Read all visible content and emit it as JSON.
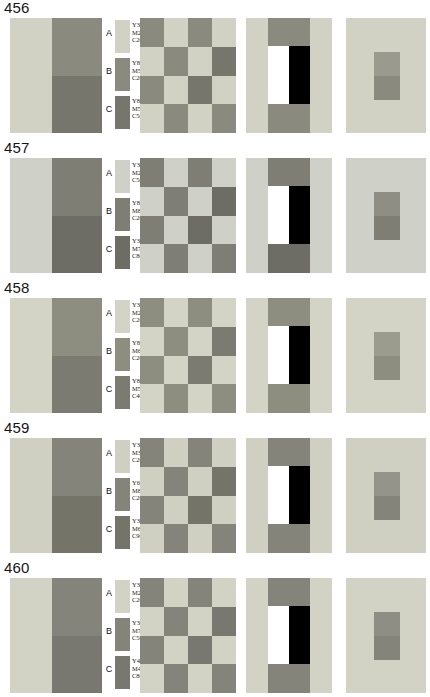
{
  "figure": {
    "legend_labels": [
      "A",
      "B",
      "C"
    ]
  },
  "rows": [
    {
      "number": "456",
      "legend": [
        {
          "label": "A",
          "y": "Y30",
          "m": "M20",
          "c": "C20",
          "swatch": "#d2d2c4"
        },
        {
          "label": "B",
          "y": "Y80",
          "m": "M50",
          "c": "C20",
          "swatch": "#8a8a7e"
        },
        {
          "label": "C",
          "y": "Y80",
          "m": "M50",
          "c": "C50",
          "swatch": "#76766c"
        }
      ],
      "panel1": {
        "left": "#d2d2c4",
        "right_top": "#8a8a7e",
        "right_bottom": "#76766c"
      },
      "panel2": [
        [
          "#8a8a7e",
          "#d2d2c4",
          "#8a8a7e",
          "#d2d2c4"
        ],
        [
          "#d2d2c4",
          "#8a8a7e",
          "#d2d2c4",
          "#76766c"
        ],
        [
          "#8a8a7e",
          "#d2d2c4",
          "#76766c",
          "#d2d2c4"
        ],
        [
          "#d2d2c4",
          "#8a8a7e",
          "#d2d2c4",
          "#8a8a7e"
        ]
      ],
      "panel3": {
        "background": "#d2d2c4",
        "band_top": "#8a8a7e",
        "band_bottom": "#8a8a7e",
        "band_mid": "#8a8a7e",
        "white_bar": "#ffffff",
        "black_bar": "#000000"
      },
      "panel4": {
        "field": "#d2d2c4",
        "patch_top": "#9a9a8e",
        "patch_bottom": "#8a8a7e"
      }
    },
    {
      "number": "457",
      "legend": [
        {
          "label": "A",
          "y": "Y30",
          "m": "M20",
          "c": "C50",
          "swatch": "#cfd0c8"
        },
        {
          "label": "B",
          "y": "Y80",
          "m": "M80",
          "c": "C20",
          "swatch": "#7e7e74"
        },
        {
          "label": "C",
          "y": "Y30",
          "m": "M70",
          "c": "C80",
          "swatch": "#6d6d66"
        }
      ],
      "panel1": {
        "left": "#cfd0c8",
        "right_top": "#7e7e74",
        "right_bottom": "#6d6d66"
      },
      "panel2": [
        [
          "#7e7e74",
          "#cfd0c8",
          "#7e7e74",
          "#cfd0c8"
        ],
        [
          "#cfd0c8",
          "#7e7e74",
          "#cfd0c8",
          "#6d6d66"
        ],
        [
          "#7e7e74",
          "#cfd0c8",
          "#6d6d66",
          "#cfd0c8"
        ],
        [
          "#cfd0c8",
          "#7e7e74",
          "#cfd0c8",
          "#7e7e74"
        ]
      ],
      "panel3": {
        "background": "#cfd0c8",
        "band_top": "#7e7e74",
        "band_bottom": "#6d6d66",
        "band_mid": "#7e7e74",
        "white_bar": "#ffffff",
        "black_bar": "#000000"
      },
      "panel4": {
        "field": "#cfd0c8",
        "patch_top": "#8e8e84",
        "patch_bottom": "#7e7e74"
      }
    },
    {
      "number": "458",
      "legend": [
        {
          "label": "A",
          "y": "Y30",
          "m": "M20",
          "c": "C20",
          "swatch": "#d4d4c6"
        },
        {
          "label": "B",
          "y": "Y80",
          "m": "M60",
          "c": "C20",
          "swatch": "#8d8d80"
        },
        {
          "label": "C",
          "y": "Y80",
          "m": "M50",
          "c": "C40",
          "swatch": "#7b7b71"
        }
      ],
      "panel1": {
        "left": "#d4d4c6",
        "right_top": "#8d8d80",
        "right_bottom": "#7b7b71"
      },
      "panel2": [
        [
          "#8d8d80",
          "#d4d4c6",
          "#8d8d80",
          "#d4d4c6"
        ],
        [
          "#d4d4c6",
          "#8d8d80",
          "#d4d4c6",
          "#7b7b71"
        ],
        [
          "#8d8d80",
          "#d4d4c6",
          "#7b7b71",
          "#d4d4c6"
        ],
        [
          "#d4d4c6",
          "#8d8d80",
          "#d4d4c6",
          "#8d8d80"
        ]
      ],
      "panel3": {
        "background": "#d4d4c6",
        "band_top": "#8d8d80",
        "band_bottom": "#8d8d80",
        "band_mid": "#8d8d80",
        "white_bar": "#ffffff",
        "black_bar": "#000000"
      },
      "panel4": {
        "field": "#d4d4c6",
        "patch_top": "#9b9b8e",
        "patch_bottom": "#8d8d80"
      }
    },
    {
      "number": "459",
      "legend": [
        {
          "label": "A",
          "y": "Y30",
          "m": "M30",
          "c": "C20",
          "swatch": "#d0d0c2"
        },
        {
          "label": "B",
          "y": "Y60",
          "m": "M80",
          "c": "C20",
          "swatch": "#84847a"
        },
        {
          "label": "C",
          "y": "Y30",
          "m": "M60",
          "c": "C90",
          "swatch": "#747468"
        }
      ],
      "panel1": {
        "left": "#d0d0c2",
        "right_top": "#84847a",
        "right_bottom": "#747468"
      },
      "panel2": [
        [
          "#84847a",
          "#d0d0c2",
          "#84847a",
          "#d0d0c2"
        ],
        [
          "#d0d0c2",
          "#84847a",
          "#d0d0c2",
          "#747468"
        ],
        [
          "#84847a",
          "#d0d0c2",
          "#747468",
          "#d0d0c2"
        ],
        [
          "#d0d0c2",
          "#84847a",
          "#d0d0c2",
          "#84847a"
        ]
      ],
      "panel3": {
        "background": "#d0d0c2",
        "band_top": "#84847a",
        "band_bottom": "#84847a",
        "band_mid": "#84847a",
        "white_bar": "#ffffff",
        "black_bar": "#000000"
      },
      "panel4": {
        "field": "#d0d0c2",
        "patch_top": "#94948a",
        "patch_bottom": "#84847a"
      }
    },
    {
      "number": "460",
      "legend": [
        {
          "label": "A",
          "y": "Y30",
          "m": "M20",
          "c": "C20",
          "swatch": "#d3d3c5"
        },
        {
          "label": "B",
          "y": "Y30",
          "m": "M70",
          "c": "C50",
          "swatch": "#84847b"
        },
        {
          "label": "C",
          "y": "Y40",
          "m": "M40",
          "c": "C80",
          "swatch": "#787870"
        }
      ],
      "panel1": {
        "left": "#d3d3c5",
        "right_top": "#84847b",
        "right_bottom": "#787870"
      },
      "panel2": [
        [
          "#84847b",
          "#d3d3c5",
          "#84847b",
          "#d3d3c5"
        ],
        [
          "#d3d3c5",
          "#84847b",
          "#d3d3c5",
          "#787870"
        ],
        [
          "#84847b",
          "#d3d3c5",
          "#787870",
          "#d3d3c5"
        ],
        [
          "#d3d3c5",
          "#84847b",
          "#d3d3c5",
          "#84847b"
        ]
      ],
      "panel3": {
        "background": "#d3d3c5",
        "band_top": "#84847b",
        "band_bottom": "#84847b",
        "band_mid": "#84847b",
        "white_bar": "#ffffff",
        "black_bar": "#000000"
      },
      "panel4": {
        "field": "#d3d3c5",
        "patch_top": "#8e8e85",
        "patch_bottom": "#84847b"
      }
    }
  ]
}
